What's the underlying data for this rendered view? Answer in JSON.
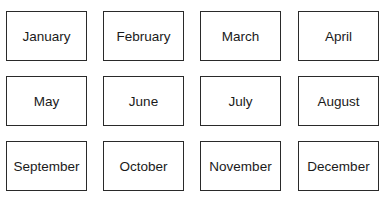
{
  "months": [
    {
      "label": "January"
    },
    {
      "label": "February"
    },
    {
      "label": "March"
    },
    {
      "label": "April"
    },
    {
      "label": "May"
    },
    {
      "label": "June"
    },
    {
      "label": "July"
    },
    {
      "label": "August"
    },
    {
      "label": "September"
    },
    {
      "label": "October"
    },
    {
      "label": "November"
    },
    {
      "label": "December"
    }
  ]
}
